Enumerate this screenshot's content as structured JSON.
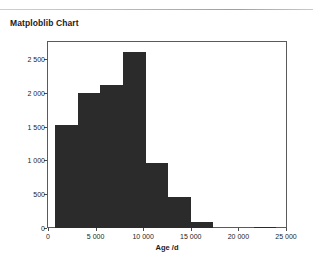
{
  "card": {
    "title": "Matploblib Chart"
  },
  "chart_data": {
    "type": "bar",
    "title": "",
    "xlabel": "Age /d",
    "ylabel": "",
    "xlim": [
      0,
      25000
    ],
    "ylim": [
      0,
      2750
    ],
    "grid": false,
    "legend": null,
    "bar_color": "#2b2b2b",
    "bin_width": 2375,
    "categories": [
      "750–3125",
      "3125–5500",
      "5500–7875",
      "7875–10250",
      "10250–12625",
      "12625–15000",
      "15000–19000",
      "21600–23600"
    ],
    "x": [
      750,
      3125,
      5500,
      7875,
      10250,
      12625,
      15000,
      21600
    ],
    "values": [
      1530,
      1990,
      2115,
      2600,
      960,
      460,
      90,
      20
    ],
    "xticks": [
      0,
      5000,
      10000,
      15000,
      20000,
      25000
    ],
    "xticklabels": [
      "0",
      "5 000",
      "10 000",
      "15 000",
      "20 000",
      "25 000"
    ],
    "yticks": [
      0,
      500,
      1000,
      1500,
      2000,
      2500
    ],
    "yticklabels": [
      "0",
      "500",
      "1 000",
      "1 500",
      "2 000",
      "2 500"
    ]
  }
}
